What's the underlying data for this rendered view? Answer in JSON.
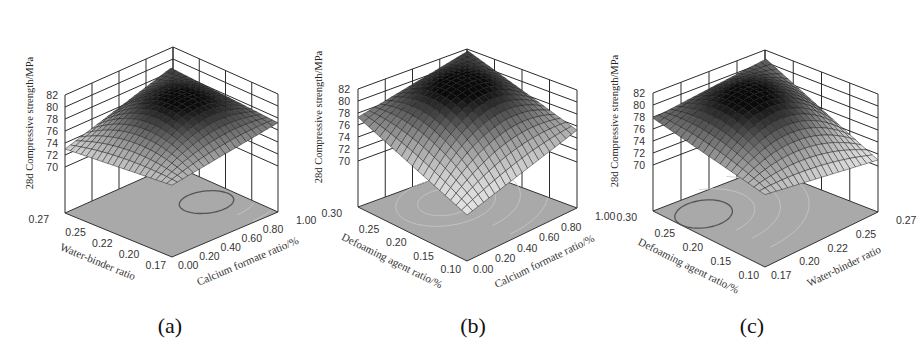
{
  "figure": {
    "panels": [
      {
        "caption": "(a)"
      },
      {
        "caption": "(b)"
      },
      {
        "caption": "(c)"
      }
    ]
  },
  "chart_data": [
    {
      "type": "surface3d",
      "caption": "(a)",
      "zlabel": "28d Compressive strength/MPa",
      "zticks": [
        "70",
        "72",
        "74",
        "76",
        "78",
        "80",
        "82"
      ],
      "zlim": [
        70,
        82
      ],
      "left_axis": {
        "label": "Water-binder ratio",
        "ticks": [
          "0.27",
          "0.25",
          "0.22",
          "0.20",
          "0.17"
        ]
      },
      "right_axis": {
        "label": "Calcium formate ratio/%",
        "ticks": [
          "0.00",
          "0.20",
          "0.40",
          "0.60",
          "0.80",
          "1.00"
        ]
      },
      "surface": {
        "peak_z": 80.3,
        "corner_left_z": 73.0,
        "corner_front_z": 74.3,
        "corner_right_z": 77.2,
        "corner_back_z": 79.0
      },
      "contour_floor": {
        "highlighted_ellipse": "near high calcium formate, mid-low water-binder"
      }
    },
    {
      "type": "surface3d",
      "caption": "(b)",
      "zlabel": "28d Compressive strength/MPa",
      "zticks": [
        "70",
        "72",
        "74",
        "76",
        "78",
        "80",
        "82"
      ],
      "zlim": [
        70,
        82
      ],
      "left_axis": {
        "label": "Defoaming agent ratio/%",
        "ticks": [
          "0.30",
          "0.25",
          "0.20",
          "0.15",
          "0.10"
        ]
      },
      "right_axis": {
        "label": "Calcium formate ratio/%",
        "ticks": [
          "0.00",
          "0.20",
          "0.40",
          "0.60",
          "0.80",
          "1.00"
        ]
      },
      "surface": {
        "peak_z": 80.8,
        "corner_left_z": 77.3,
        "corner_front_z": 70.0,
        "corner_right_z": 75.3,
        "corner_back_z": 79.5
      }
    },
    {
      "type": "surface3d",
      "caption": "(c)",
      "zlabel": "28d Compressive strength/MPa",
      "zticks": [
        "70",
        "72",
        "74",
        "76",
        "78",
        "80",
        "82"
      ],
      "zlim": [
        70,
        82
      ],
      "left_axis": {
        "label": "Defoaming agent ratio/%",
        "ticks": [
          "0.30",
          "0.25",
          "0.20",
          "0.15",
          "0.10"
        ]
      },
      "right_axis": {
        "label": "Water-binder ratio",
        "ticks": [
          "0.17",
          "0.20",
          "0.22",
          "0.25",
          "0.27"
        ]
      },
      "surface": {
        "peak_z": 80.6,
        "corner_left_z": 77.8,
        "corner_front_z": 74.4,
        "corner_right_z": 71.0,
        "corner_back_z": 78.5
      },
      "contour_floor": {
        "highlighted_ellipse": "near high defoaming agent, low water-binder"
      }
    }
  ]
}
